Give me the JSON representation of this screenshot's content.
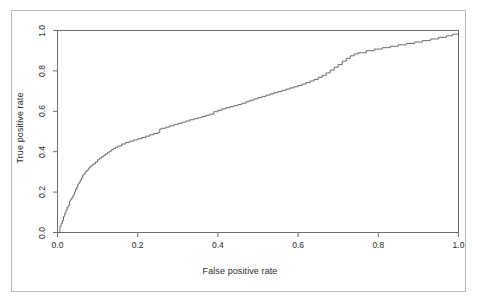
{
  "figure": {
    "background_color": "#ffffff",
    "frame_color": "#b9b9b9",
    "axis_color": "#6e6e6e",
    "curve_color": "#5a5a5a",
    "text_color": "#2b2b2b"
  },
  "chart_data": {
    "type": "line",
    "title": "",
    "subtitle": "",
    "xlabel": "False positive rate",
    "ylabel": "True positive rate",
    "xlim": [
      0.0,
      1.0
    ],
    "ylim": [
      0.0,
      1.0
    ],
    "grid": false,
    "legend": null,
    "legend_position": "none",
    "xticks": [
      0.0,
      0.2,
      0.4,
      0.6,
      0.8,
      1.0
    ],
    "xtick_labels": [
      "0.0",
      "0.2",
      "0.4",
      "0.6",
      "0.8",
      "1.0"
    ],
    "yticks": [
      0.0,
      0.2,
      0.4,
      0.6,
      0.8,
      1.0
    ],
    "ytick_labels": [
      "0.0",
      "0.2",
      "0.4",
      "0.6",
      "0.8",
      "1.0"
    ],
    "annotations": [],
    "series": [
      {
        "name": "ROC curve",
        "style": "step",
        "color": "#5a5a5a",
        "x": [
          0.0,
          0.003,
          0.006,
          0.006,
          0.009,
          0.009,
          0.012,
          0.012,
          0.015,
          0.015,
          0.018,
          0.018,
          0.021,
          0.021,
          0.024,
          0.024,
          0.027,
          0.03,
          0.03,
          0.033,
          0.036,
          0.039,
          0.042,
          0.045,
          0.048,
          0.051,
          0.054,
          0.057,
          0.06,
          0.063,
          0.066,
          0.069,
          0.072,
          0.075,
          0.078,
          0.081,
          0.084,
          0.087,
          0.09,
          0.095,
          0.1,
          0.105,
          0.11,
          0.115,
          0.12,
          0.125,
          0.13,
          0.135,
          0.14,
          0.145,
          0.15,
          0.16,
          0.17,
          0.18,
          0.19,
          0.2,
          0.21,
          0.22,
          0.23,
          0.24,
          0.25,
          0.255,
          0.26,
          0.27,
          0.28,
          0.29,
          0.3,
          0.31,
          0.32,
          0.33,
          0.34,
          0.35,
          0.36,
          0.37,
          0.38,
          0.39,
          0.4,
          0.41,
          0.42,
          0.43,
          0.44,
          0.45,
          0.46,
          0.47,
          0.48,
          0.49,
          0.5,
          0.51,
          0.52,
          0.53,
          0.54,
          0.55,
          0.56,
          0.57,
          0.58,
          0.59,
          0.6,
          0.61,
          0.62,
          0.63,
          0.64,
          0.65,
          0.66,
          0.67,
          0.68,
          0.69,
          0.7,
          0.71,
          0.72,
          0.73,
          0.74,
          0.75,
          0.77,
          0.79,
          0.81,
          0.83,
          0.85,
          0.87,
          0.89,
          0.91,
          0.93,
          0.95,
          0.97,
          0.985,
          1.0
        ],
        "y": [
          0.0,
          0.0,
          0.01,
          0.03,
          0.03,
          0.045,
          0.045,
          0.06,
          0.06,
          0.08,
          0.08,
          0.095,
          0.095,
          0.11,
          0.11,
          0.125,
          0.135,
          0.135,
          0.155,
          0.165,
          0.175,
          0.185,
          0.2,
          0.215,
          0.225,
          0.24,
          0.25,
          0.26,
          0.27,
          0.285,
          0.29,
          0.3,
          0.305,
          0.31,
          0.32,
          0.325,
          0.33,
          0.335,
          0.34,
          0.35,
          0.36,
          0.368,
          0.375,
          0.382,
          0.39,
          0.397,
          0.403,
          0.41,
          0.416,
          0.422,
          0.428,
          0.438,
          0.446,
          0.452,
          0.458,
          0.464,
          0.47,
          0.477,
          0.484,
          0.49,
          0.496,
          0.512,
          0.516,
          0.522,
          0.528,
          0.534,
          0.54,
          0.546,
          0.552,
          0.558,
          0.563,
          0.568,
          0.574,
          0.58,
          0.586,
          0.598,
          0.605,
          0.612,
          0.618,
          0.623,
          0.628,
          0.634,
          0.64,
          0.648,
          0.655,
          0.662,
          0.668,
          0.674,
          0.68,
          0.686,
          0.692,
          0.698,
          0.704,
          0.71,
          0.716,
          0.722,
          0.728,
          0.735,
          0.742,
          0.75,
          0.758,
          0.768,
          0.778,
          0.79,
          0.804,
          0.818,
          0.832,
          0.848,
          0.862,
          0.875,
          0.884,
          0.89,
          0.9,
          0.908,
          0.915,
          0.922,
          0.929,
          0.936,
          0.943,
          0.95,
          0.958,
          0.966,
          0.974,
          0.982,
          0.99
        ]
      }
    ]
  }
}
